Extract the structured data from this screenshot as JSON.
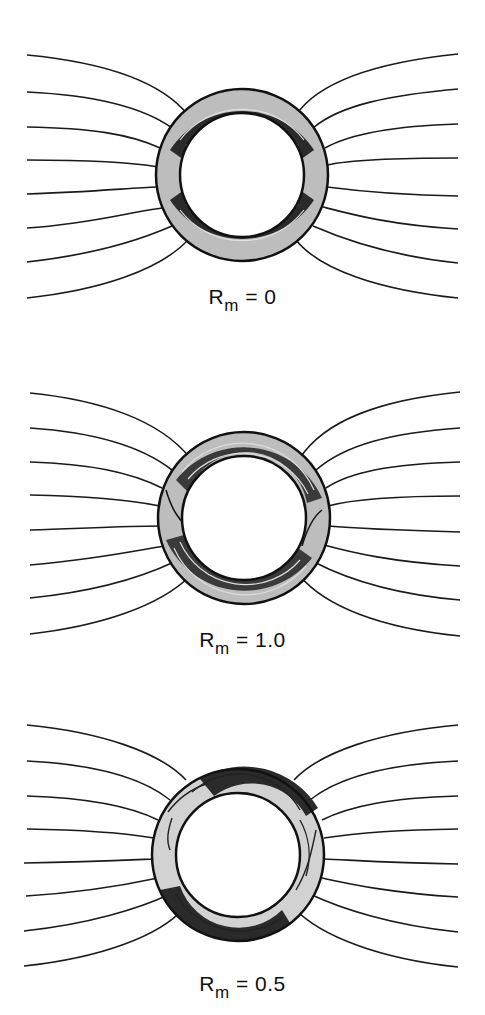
{
  "figure": {
    "line_color": "#1a1a1a",
    "shade_color": "#bdbdbd",
    "panels": [
      {
        "id": "rm-0",
        "label_main": "R",
        "label_sub": "m",
        "label_value": " = 0",
        "cx": 242,
        "cy": 175,
        "r_outer": 86,
        "r_inner": 62,
        "field_lines_per_side": 8
      },
      {
        "id": "rm-1.0",
        "label_main": "R",
        "label_sub": "m",
        "label_value": " = 1.0",
        "cx": 244,
        "cy": 518,
        "r_outer": 86,
        "r_inner": 62,
        "field_lines_per_side": 8
      },
      {
        "id": "rm-0.5",
        "label_main": "R",
        "label_sub": "m",
        "label_value": " = 0.5",
        "cx": 238,
        "cy": 855,
        "r_outer": 86,
        "r_inner": 62,
        "field_lines_per_side": 8
      }
    ]
  }
}
